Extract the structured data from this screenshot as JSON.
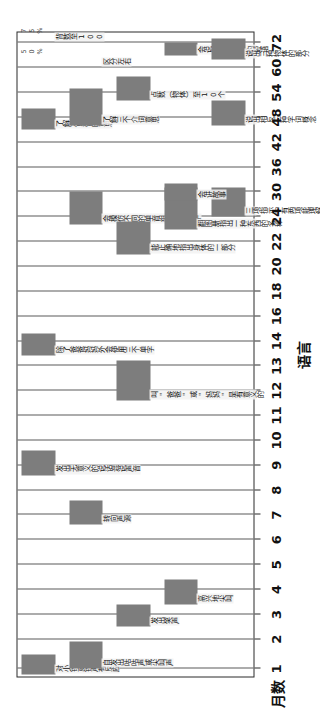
{
  "figure": {
    "axis_title": "月数",
    "category_title": "语言",
    "bar_color": "#7d7d7d",
    "label_bg": "#f2f2f2"
  },
  "annotations": [
    {
      "text": "75%",
      "month": 74.0
    },
    {
      "text": "50%",
      "month": 66.0
    }
  ],
  "chart_data": {
    "type": "bar",
    "title": "语言",
    "xlabel": "月数",
    "ylabel": "",
    "orientation": "horizontal-milestone-ranges",
    "grid": true,
    "legend": "none",
    "tick_labels": [
      "1",
      "2",
      "3",
      "4",
      "5",
      "6",
      "7",
      "8",
      "9",
      "10",
      "11",
      "12",
      "13",
      "14",
      "16",
      "18",
      "20",
      "22",
      "24",
      "30",
      "36",
      "42",
      "48",
      "54",
      "60",
      "72"
    ],
    "tick_values": [
      1,
      2,
      3,
      4,
      5,
      6,
      7,
      8,
      9,
      10,
      11,
      12,
      13,
      14,
      16,
      18,
      20,
      22,
      24,
      30,
      36,
      42,
      48,
      54,
      60,
      72
    ],
    "xlim": [
      0,
      78
    ],
    "categories": [
      "对小铃或铃声有反应",
      "自发出咕咕声或尖叫声",
      "发出笑声",
      "高兴地尖叫",
      "转向声源",
      "发出无意义的说话混说声音",
      "叫\"爸爸\"或\"妈妈\"是有意义的",
      "除了爸爸妈妈外会使用三个单字",
      "会模仿不同的单音组合成一句子",
      "能正确地指出身体的一部分",
      "翻图册指出一种东西的名称",
      "三项指示中有两项能理解能做到",
      "了解冷累饿的意思",
      "了解三个介词意思",
      "点数（物体）至10个",
      "会讲故事",
      "说出相反三种字词概念",
      "会说出六个单字的短语",
      "说出三种物体的部分",
      "区分左右",
      "背数至100"
    ],
    "bars": [
      {
        "label": "对小铃或铃声有反应",
        "start": 0.6,
        "end": 1.4,
        "row": 0
      },
      {
        "label": "自发出咕咕声或尖叫声",
        "start": 1.0,
        "end": 1.9,
        "row": 1
      },
      {
        "label": "发出笑声",
        "start": 2.5,
        "end": 3.4,
        "row": 2
      },
      {
        "label": "高兴地尖叫",
        "start": 3.4,
        "end": 4.4,
        "row": 3
      },
      {
        "label": "转向声源",
        "start": 6.6,
        "end": 7.6,
        "row": 1
      },
      {
        "label": "发出无意义的说话混说声音",
        "start": 8.6,
        "end": 9.6,
        "row": 0
      },
      {
        "label": "叫\"爸爸\"或\"妈妈\"是有意义的",
        "start": 11.6,
        "end": 13.2,
        "row": 2
      },
      {
        "label": "除了爸爸妈妈外会使用三个单字",
        "start": 13.4,
        "end": 14.6,
        "row": 0
      },
      {
        "label": "会模仿不同的单音组合成一句子",
        "start": 23.4,
        "end": 30.2,
        "row": 1
      },
      {
        "label": "能正确地指出身体的一部分",
        "start": 21.0,
        "end": 23.6,
        "row": 2
      },
      {
        "label": "翻图册指出一种东西的名称",
        "start": 23.0,
        "end": 31.0,
        "row": 3
      },
      {
        "label": "三项指示中有两项能理解能做到",
        "start": 24.0,
        "end": 31.0,
        "row": 4
      },
      {
        "label": "了解冷累饿的意思",
        "start": 45.0,
        "end": 50.2,
        "row": 0
      },
      {
        "label": "了解三个介词意思",
        "start": 46.0,
        "end": 55.0,
        "row": 1
      },
      {
        "label": "点数（物体）至10个",
        "start": 52.0,
        "end": 58.0,
        "row": 2
      },
      {
        "label": "会讲故事",
        "start": 28.0,
        "end": 32.0,
        "row": 3
      },
      {
        "label": "说出相反三种字词概念",
        "start": 46.0,
        "end": 52.0,
        "row": 4
      },
      {
        "label": "会说出六个单字的短语",
        "start": 66.0,
        "end": 72.0,
        "row": 3
      },
      {
        "label": "说出三种物体的部分",
        "start": 64.0,
        "end": 73.0,
        "row": 4
      },
      {
        "label": "区分左右",
        "start": 60.0,
        "end": 60.0,
        "row": 1
      },
      {
        "label": "背数至100",
        "start": 72.0,
        "end": 72.0,
        "row": 0
      }
    ]
  }
}
